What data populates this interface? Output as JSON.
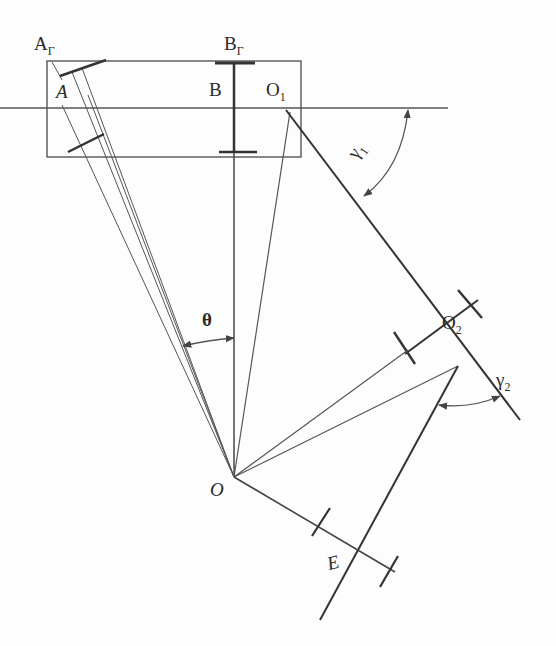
{
  "diagram": {
    "type": "geometric-construction",
    "stroke_color": "#333333",
    "thin_color": "#666666",
    "labels": {
      "A_gamma": {
        "base": "A",
        "sub": "Г"
      },
      "B_gamma": {
        "base": "B",
        "sub": "Г"
      },
      "A": {
        "base": "A",
        "sub": ""
      },
      "B": {
        "base": "B",
        "sub": ""
      },
      "O1": {
        "base": "O",
        "sub": "1"
      },
      "O2": {
        "base": "O",
        "sub": "2"
      },
      "O": {
        "base": "O",
        "sub": ""
      },
      "E": {
        "base": "E",
        "sub": ""
      },
      "theta": {
        "base": "θ",
        "sub": ""
      },
      "gamma1": {
        "base": "γ",
        "sub": "1"
      },
      "gamma2": {
        "base": "γ",
        "sub": "2"
      }
    },
    "points": {
      "O": [
        234,
        477
      ],
      "O1": [
        286,
        110
      ],
      "O2": [
        433,
        326
      ],
      "E": [
        350,
        560
      ],
      "B_top": [
        234,
        62
      ],
      "A_top": [
        72,
        70
      ]
    }
  }
}
